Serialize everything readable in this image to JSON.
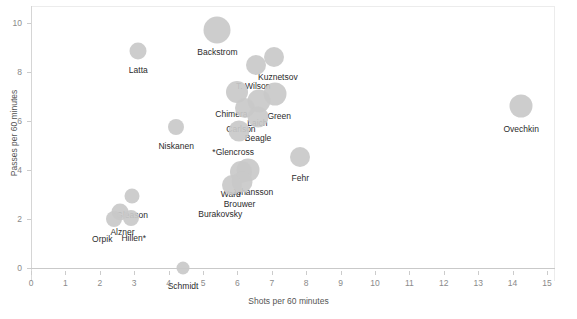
{
  "chart_data": {
    "type": "scatter",
    "title": "",
    "xlabel": "Shots per 60 minutes",
    "ylabel": "Passes per 60 minutes",
    "xlim": [
      0,
      15.2
    ],
    "ylim": [
      -0.6,
      10.6
    ],
    "xticks": [
      0,
      1,
      2,
      3,
      4,
      5,
      6,
      7,
      8,
      9,
      10,
      11,
      12,
      13,
      14,
      15
    ],
    "yticks": [
      0,
      2,
      4,
      6,
      8,
      10
    ],
    "grid": false,
    "legend": "none",
    "marker_color": "#c9c9c9",
    "size_encoding": "bubble area varies by player",
    "points": [
      {
        "label": "Backstrom",
        "x": 5.42,
        "y": 9.72,
        "r": 13.5,
        "label_dx": 0,
        "label_dy": 17
      },
      {
        "label": "Latta",
        "x": 3.12,
        "y": 8.86,
        "r": 8.5,
        "label_dx": 0,
        "label_dy": 14
      },
      {
        "label": "Kuznetsov",
        "x": 7.06,
        "y": 8.62,
        "r": 10.0,
        "label_dx": 4,
        "label_dy": 15
      },
      {
        "label": "T. Wilson",
        "x": 6.55,
        "y": 8.28,
        "r": 10.0,
        "label_dx": -3,
        "label_dy": 16
      },
      {
        "label": "Chimera",
        "x": 6.0,
        "y": 7.18,
        "r": 11.0,
        "label_dx": -6,
        "label_dy": 17
      },
      {
        "label": "Green",
        "x": 7.1,
        "y": 7.12,
        "r": 11.5,
        "label_dx": 4,
        "label_dy": 17
      },
      {
        "label": "Laich",
        "x": 6.64,
        "y": 6.8,
        "r": 11.5,
        "label_dx": -2,
        "label_dy": 17
      },
      {
        "label": "Carlson",
        "x": 6.22,
        "y": 6.52,
        "r": 10.0,
        "label_dx": -4,
        "label_dy": 16
      },
      {
        "label": "Beagle",
        "x": 6.6,
        "y": 6.15,
        "r": 10.5,
        "label_dx": 0,
        "label_dy": 16
      },
      {
        "label": "Niskanen",
        "x": 4.22,
        "y": 5.76,
        "r": 8.0,
        "label_dx": 0,
        "label_dy": 14
      },
      {
        "label": "*Glencross",
        "x": 6.05,
        "y": 5.58,
        "r": 10.5,
        "label_dx": -6,
        "label_dy": 16
      },
      {
        "label": "Ovechkin",
        "x": 14.25,
        "y": 6.62,
        "r": 11.5,
        "label_dx": 0,
        "label_dy": 18
      },
      {
        "label": "Fehr",
        "x": 7.83,
        "y": 4.55,
        "r": 10.0,
        "label_dx": 0,
        "label_dy": 16
      },
      {
        "label": "Johansson",
        "x": 6.3,
        "y": 4.02,
        "r": 11.5,
        "label_dx": 5,
        "label_dy": 17
      },
      {
        "label": "Ward",
        "x": 6.1,
        "y": 3.92,
        "r": 11.0,
        "label_dx": -10,
        "label_dy": 17
      },
      {
        "label": "Brouwer",
        "x": 6.12,
        "y": 3.52,
        "r": 10.5,
        "label_dx": -2,
        "label_dy": 17
      },
      {
        "label": "Burakovsky",
        "x": 5.85,
        "y": 3.4,
        "r": 10.0,
        "label_dx": -12,
        "label_dy": 24
      },
      {
        "label": "*Gleason",
        "x": 2.95,
        "y": 2.94,
        "r": 7.5,
        "label_dx": -2,
        "label_dy": 14
      },
      {
        "label": "Alzner",
        "x": 2.6,
        "y": 2.28,
        "r": 8.5,
        "label_dx": 2,
        "label_dy": 15
      },
      {
        "label": "Hillen*",
        "x": 2.9,
        "y": 2.06,
        "r": 8.0,
        "label_dx": 3,
        "label_dy": 15
      },
      {
        "label": "Orpik",
        "x": 2.42,
        "y": 1.98,
        "r": 8.0,
        "label_dx": -12,
        "label_dy": 15
      },
      {
        "label": "Schmidt",
        "x": 4.42,
        "y": 0.0,
        "r": 6.5,
        "label_dx": 0,
        "label_dy": 13
      }
    ]
  }
}
